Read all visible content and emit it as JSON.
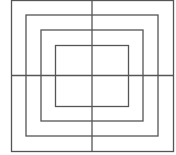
{
  "diagram": {
    "stroke_color": "#555555",
    "background": "#ffffff",
    "rectangles": [
      {
        "x": 11.5,
        "y": 0.5,
        "w": 162,
        "h": 151
      },
      {
        "x": 26,
        "y": 15,
        "w": 132,
        "h": 121
      },
      {
        "x": 41,
        "y": 30,
        "w": 102,
        "h": 91
      },
      {
        "x": 55.5,
        "y": 45.5,
        "w": 73,
        "h": 61
      }
    ],
    "lines": [
      {
        "x1": 11,
        "y1": 75.5,
        "x2": 174,
        "y2": 75.5
      },
      {
        "x1": 92,
        "y1": 0,
        "x2": 92,
        "y2": 152
      }
    ]
  }
}
